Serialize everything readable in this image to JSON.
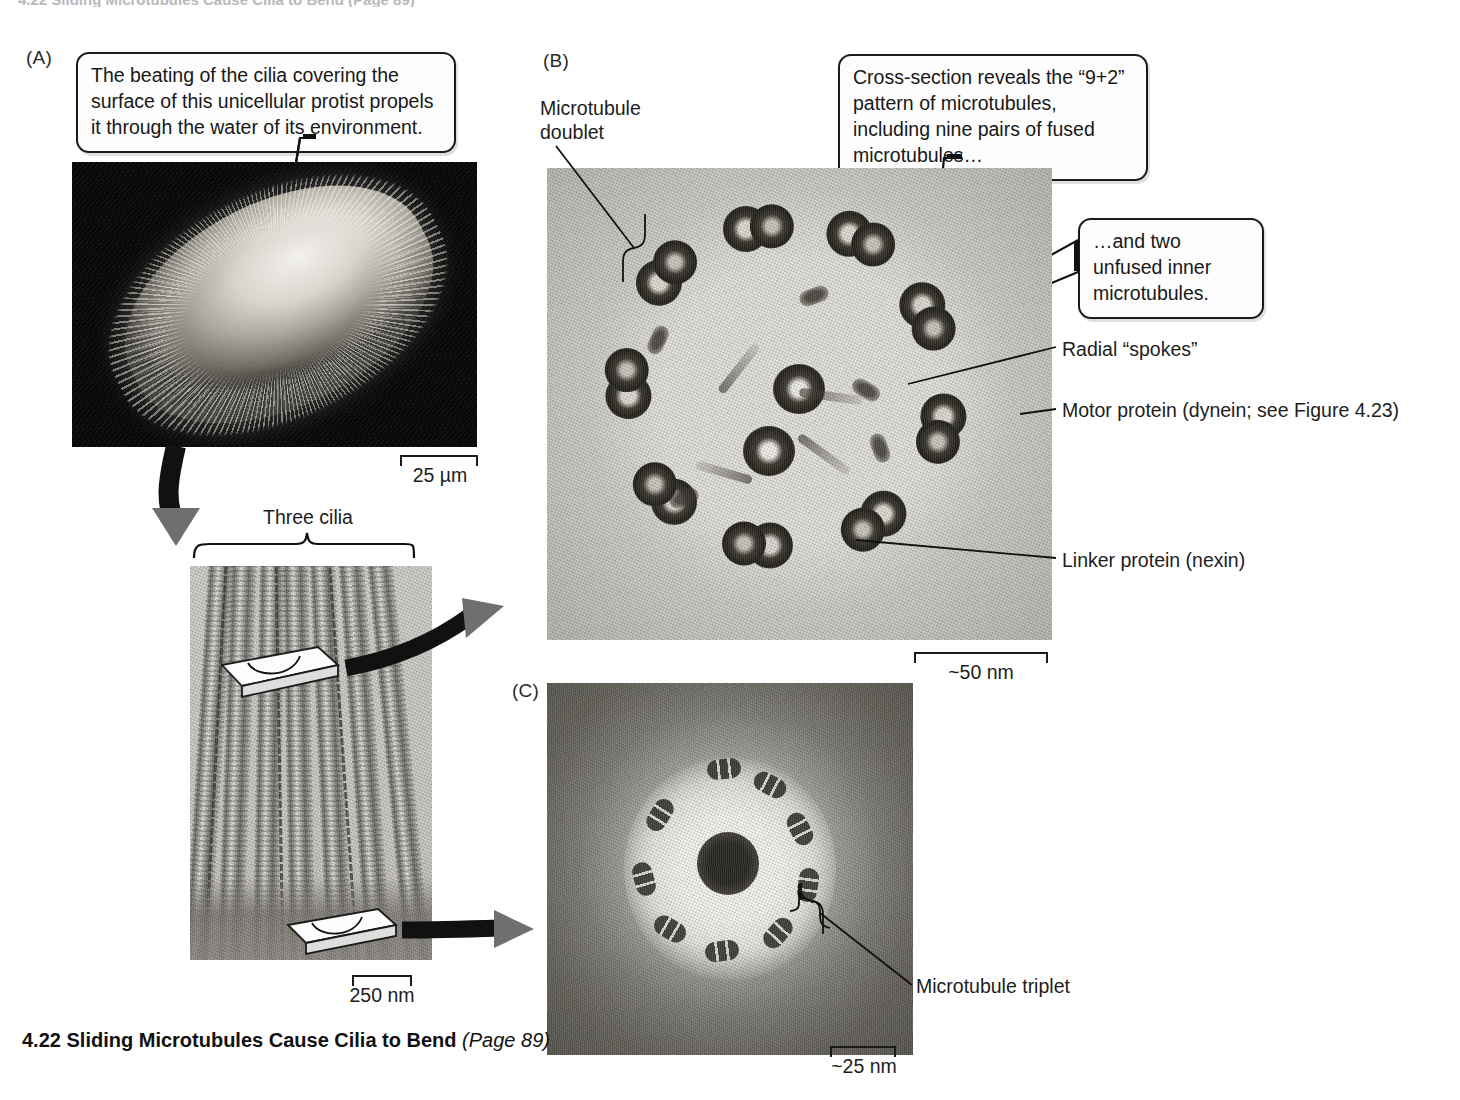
{
  "figure": {
    "number": "4.22",
    "title": "Sliding Microtubules Cause Cilia to Bend",
    "page_ref": "(Page 89)",
    "header_sliver": "4.22 Sliding Microtubules Cause Cilia to Bend (Page 89)"
  },
  "panels": {
    "a": {
      "letter": "(A)",
      "callout": "The beating of the cilia covering the\nsurface of this unicellular protist propels it\nthrough the water of its environment.",
      "scale_bar": "25 µm",
      "bracket_label": "Three cilia",
      "detail_scale_bar": "250 nm"
    },
    "b": {
      "letter": "(B)",
      "callout_main": "Cross-section reveals the “9+2”\npattern of microtubules, including\nnine pairs of fused microtubules…",
      "callout_secondary": "…and two unfused\ninner microtubules.",
      "label_doublet": "Microtubule\ndoublet",
      "label_spokes": "Radial “spokes”",
      "label_dynein": "Motor protein (dynein; see Figure 4.23)",
      "label_nexin": "Linker protein (nexin)",
      "scale_bar": "~50 nm"
    },
    "c": {
      "letter": "(C)",
      "label_triplet": "Microtubule triplet",
      "scale_bar": "~25 nm"
    }
  },
  "colors": {
    "ink": "#111111",
    "arrow_gray": "#6f6f6f",
    "page_background": "#ffffff",
    "sem_background": "#060606"
  },
  "icons": {
    "curved_arrow": "curved-arrow-icon",
    "block_arrow": "block-arrow-icon",
    "cut_plane": "cut-plane-icon"
  }
}
